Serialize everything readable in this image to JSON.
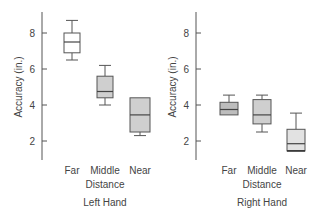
{
  "chart_data": [
    {
      "type": "box",
      "title": "Left Hand",
      "xlabel": "Left Hand",
      "ylabel": "Accuracy (in.)",
      "yticks": [
        2,
        4,
        6,
        8
      ],
      "ylim": [
        1,
        9.2
      ],
      "grid": false,
      "categories": [
        "Far",
        "Middle Distance",
        "Near"
      ],
      "category_lines": [
        [
          "Far"
        ],
        [
          "Middle",
          "Distance"
        ],
        [
          "Near"
        ]
      ],
      "boxes": [
        {
          "category": "Far",
          "whisker_low": 6.5,
          "q1": 6.9,
          "median": 7.5,
          "q3": 8.0,
          "whisker_high": 8.7,
          "fill": "#ffffff"
        },
        {
          "category": "Middle Distance",
          "whisker_low": 4.0,
          "q1": 4.4,
          "median": 4.75,
          "q3": 5.6,
          "whisker_high": 6.2,
          "fill": "#cfcfcf"
        },
        {
          "category": "Near",
          "whisker_low": 2.3,
          "q1": 2.5,
          "median": 3.45,
          "q3": 4.4,
          "whisker_high": 4.4,
          "fill": "#cfcfcf"
        }
      ]
    },
    {
      "type": "box",
      "title": "Right Hand",
      "xlabel": "Right Hand",
      "ylabel": "Accuracy (in.)",
      "yticks": [
        2,
        4,
        6,
        8
      ],
      "ylim": [
        1,
        9.2
      ],
      "grid": false,
      "categories": [
        "Far",
        "Middle Distance",
        "Near"
      ],
      "category_lines": [
        [
          "Far"
        ],
        [
          "Middle",
          "Distance"
        ],
        [
          "Near"
        ]
      ],
      "boxes": [
        {
          "category": "Far",
          "whisker_low": 3.45,
          "q1": 3.45,
          "median": 3.75,
          "q3": 4.15,
          "whisker_high": 4.55,
          "fill": "#bdbdbd"
        },
        {
          "category": "Middle Distance",
          "whisker_low": 2.5,
          "q1": 2.95,
          "median": 3.45,
          "q3": 4.3,
          "whisker_high": 4.55,
          "fill": "#cfcfcf"
        },
        {
          "category": "Near",
          "whisker_low": 1.45,
          "q1": 1.45,
          "median": 1.85,
          "q3": 2.65,
          "whisker_high": 3.55,
          "fill": "#e2e2e2"
        }
      ]
    }
  ],
  "colors": {
    "axis": "#555555",
    "box_stroke": "#555555"
  }
}
